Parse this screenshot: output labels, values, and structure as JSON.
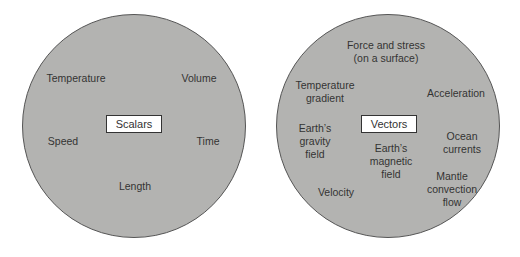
{
  "scalars": {
    "title": "Scalars",
    "items": [
      "Temperature",
      "Volume",
      "Speed",
      "Time",
      "Length"
    ]
  },
  "vectors": {
    "title": "Vectors",
    "items": [
      "Force and stress",
      "(on a surface)",
      "Temperature",
      "gradient",
      "Acceleration",
      "Earth’s",
      "gravity",
      "field",
      "Earth’s",
      "magnetic",
      "field",
      "Ocean",
      "currents",
      "Mantle",
      "convection",
      "flow",
      "Velocity"
    ]
  },
  "colors": {
    "circle_fill": "#b3b3b1",
    "circle_border": "#555555",
    "box_fill": "#ffffff"
  }
}
